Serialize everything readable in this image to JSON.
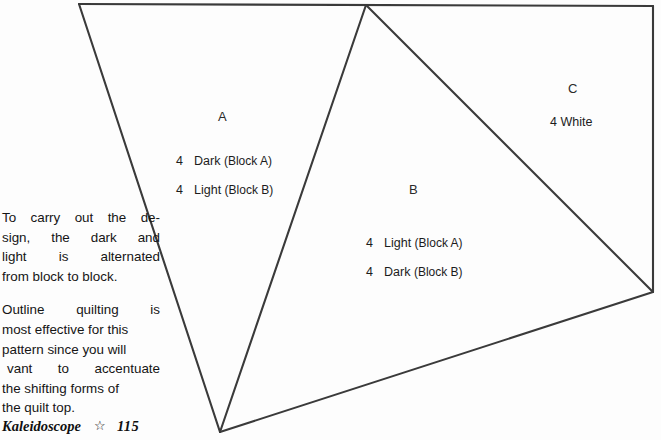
{
  "page": {
    "width": 661,
    "height": 440,
    "background": "#fdfdfd",
    "line_color": "#3a3a3a"
  },
  "diagram": {
    "name": "kaleidoscope-quilt-block-piecing-diagram",
    "vertices": {
      "top_left": [
        79,
        4
      ],
      "apex": [
        366,
        5
      ],
      "top_right": [
        653,
        6
      ],
      "right_bottom": [
        653,
        292
      ],
      "bottom": [
        220,
        432
      ]
    },
    "edges": [
      {
        "name": "top-edge",
        "from": [
          79,
          4
        ],
        "to": [
          653,
          6
        ]
      },
      {
        "name": "left-edge",
        "from": [
          79,
          4
        ],
        "to": [
          220,
          432
        ]
      },
      {
        "name": "center-left-edge",
        "from": [
          366,
          5
        ],
        "to": [
          220,
          432
        ]
      },
      {
        "name": "center-right-diagonal",
        "from": [
          366,
          5
        ],
        "to": [
          653,
          292
        ]
      },
      {
        "name": "right-edge",
        "from": [
          653,
          6
        ],
        "to": [
          653,
          292
        ]
      },
      {
        "name": "bottom-edge",
        "from": [
          220,
          432
        ],
        "to": [
          653,
          292
        ]
      }
    ],
    "regions": [
      {
        "letter": "A",
        "letter_pos": [
          224,
          117
        ],
        "pieces": [
          {
            "qty": "4",
            "shade": "Dark",
            "block": "(Block A)",
            "pos": [
              176,
              161
            ]
          },
          {
            "qty": "4",
            "shade": "Light",
            "block": "(Block B)",
            "pos": [
              176,
              190
            ]
          }
        ]
      },
      {
        "letter": "B",
        "letter_pos": [
          414,
          190
        ],
        "pieces": [
          {
            "qty": "4",
            "shade": "Light",
            "block": "(Block A)",
            "pos": [
              366,
              243
            ]
          },
          {
            "qty": "4",
            "shade": "Dark",
            "block": "(Block B)",
            "pos": [
              366,
              272
            ]
          }
        ]
      },
      {
        "letter": "C",
        "letter_pos": [
          573,
          89
        ],
        "pieces": [
          {
            "qty": "4",
            "shade": "White",
            "block": "",
            "pos": [
              550,
              122
            ]
          }
        ]
      }
    ]
  },
  "body_copy": {
    "paragraph_1": {
      "lines": [
        "To carry out the de-",
        "sign, the dark and",
        "light is alternated",
        "from block to block."
      ]
    },
    "paragraph_2": {
      "lines": [
        "Outline quilting is",
        "most effective for this",
        "pattern since you will",
        "vant to accentuate",
        "the shifting forms of",
        "the quilt top."
      ]
    }
  },
  "footer": {
    "book_title": "Kaleidoscope",
    "ornament": "☆",
    "ornament_name": "star-outline-icon",
    "page_number": "115"
  }
}
